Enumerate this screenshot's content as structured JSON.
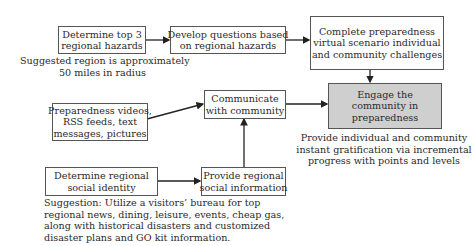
{
  "diagram": {
    "nodes": {
      "top_hazards": {
        "lines": [
          "Determine top 3",
          "regional hazards"
        ]
      },
      "develop_questions": {
        "lines": [
          "Develop questions based",
          "on regional hazards"
        ]
      },
      "complete_scenario": {
        "lines": [
          "Complete preparedness",
          "virtual scenario individual",
          "and community challenges"
        ]
      },
      "engage_community": {
        "lines": [
          "Engage the",
          "community in",
          "preparedness"
        ],
        "fill": "#cfcfcf"
      },
      "media": {
        "lines": [
          "Preparedness videos,",
          "RSS feeds, text",
          "messages, pictures"
        ]
      },
      "communicate": {
        "lines": [
          "Communicate",
          "with community"
        ]
      },
      "social_identity": {
        "lines": [
          "Determine regional",
          "social identity"
        ]
      },
      "social_info": {
        "lines": [
          "Provide regional",
          "social information"
        ]
      }
    },
    "notes": {
      "region_note": {
        "lines": [
          "Suggested region is approximately",
          "50 miles in radius"
        ]
      },
      "gratification_note": {
        "lines": [
          "Provide individual and community",
          "instant gratification via incremental",
          "progress with points and levels"
        ]
      },
      "suggestion_note": {
        "lines": [
          "Suggestion: Utilize a visitors’ bureau for top",
          "regional news, dining, leisure, events, cheap gas,",
          "along with historical disasters and customized",
          "disaster plans and GO kit information."
        ]
      }
    },
    "edges": [
      {
        "from": "top_hazards",
        "to": "develop_questions"
      },
      {
        "from": "develop_questions",
        "to": "complete_scenario"
      },
      {
        "from": "complete_scenario",
        "to": "engage_community"
      },
      {
        "from": "media",
        "to": "communicate"
      },
      {
        "from": "communicate",
        "to": "engage_community"
      },
      {
        "from": "social_identity",
        "to": "social_info"
      },
      {
        "from": "social_info",
        "to": "communicate"
      }
    ]
  }
}
